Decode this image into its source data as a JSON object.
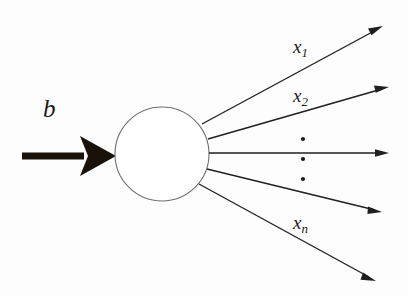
{
  "figure": {
    "name": "node-flow-diagram",
    "caption": "",
    "background_color": "#fdfdfd",
    "width": 408,
    "height": 296
  },
  "node": {
    "name": "central-node",
    "shape": "circle",
    "center_x": 162,
    "center_y": 154,
    "radius": 47,
    "fill_color": "#ffffff",
    "stroke_color": "#6e6e6e",
    "stroke_width": 1.1
  },
  "input": {
    "label": "b",
    "arrow_name": "input-arrow",
    "style": "thick-solid",
    "color": "#1a1208",
    "shaft_start_x": 22,
    "shaft_end_x": 82,
    "tip_x": 116,
    "axis_y": 156,
    "shaft_thickness": 7
  },
  "outputs": [
    {
      "label": "x",
      "subscript": "1",
      "arrow_name": "output-arrow-1",
      "origin_x": 202,
      "origin_y": 124,
      "tip_x": 383,
      "tip_y": 26
    },
    {
      "label": "x",
      "subscript": "2",
      "arrow_name": "output-arrow-2",
      "origin_x": 208,
      "origin_y": 139,
      "tip_x": 389,
      "tip_y": 87
    },
    {
      "label": "",
      "subscript": "",
      "arrow_name": "output-arrow-middle",
      "origin_x": 209,
      "origin_y": 153,
      "tip_x": 389,
      "tip_y": 153
    },
    {
      "label": "",
      "subscript": "",
      "arrow_name": "output-arrow-4",
      "origin_x": 207,
      "origin_y": 169,
      "tip_x": 382,
      "tip_y": 212
    },
    {
      "label": "x",
      "subscript": "n",
      "arrow_name": "output-arrow-n",
      "origin_x": 199,
      "origin_y": 184,
      "tip_x": 376,
      "tip_y": 281
    }
  ],
  "ellipsis": {
    "name": "vertical-ellipsis",
    "dot_count": 3,
    "x": 303,
    "y_positions": [
      139,
      159,
      179
    ],
    "radius": 2.1,
    "color": "#1a1a1a"
  },
  "stroke": {
    "ray_color": "#1f1f1f",
    "ray_width": 1.35
  }
}
